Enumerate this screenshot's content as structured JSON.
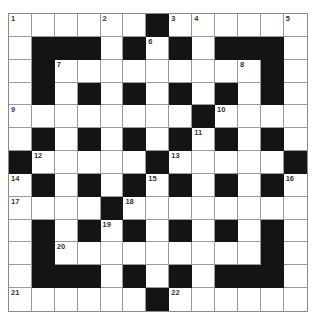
{
  "puzzle": {
    "rows": 13,
    "cols": 13,
    "layout": [
      "WWWWWWBWWWWWW",
      "WBBBWBWBWBBBW",
      "WBWWWWWWWWWBW",
      "WBWBWBWBWBWBW",
      "WWWWWWWWBWWWW",
      "WBWBWBWBWBWBW",
      "BWWWWWBWWWWWB",
      "WBWBWBWBWBWBW",
      "WWWWBWWWWWWWW",
      "WBWBWBWBWBWBW",
      "WBWWWWWWWWWBW",
      "WBBBWBWBWBBBW",
      "WWWWWWBWWWWWW"
    ],
    "numbers": [
      {
        "r": 0,
        "c": 0,
        "n": "1"
      },
      {
        "r": 0,
        "c": 4,
        "n": "2"
      },
      {
        "r": 0,
        "c": 7,
        "n": "3"
      },
      {
        "r": 0,
        "c": 8,
        "n": "4"
      },
      {
        "r": 0,
        "c": 12,
        "n": "5"
      },
      {
        "r": 1,
        "c": 6,
        "n": "6"
      },
      {
        "r": 2,
        "c": 2,
        "n": "7"
      },
      {
        "r": 2,
        "c": 10,
        "n": "8"
      },
      {
        "r": 4,
        "c": 0,
        "n": "9"
      },
      {
        "r": 4,
        "c": 9,
        "n": "10"
      },
      {
        "r": 5,
        "c": 8,
        "n": "11"
      },
      {
        "r": 6,
        "c": 1,
        "n": "12"
      },
      {
        "r": 6,
        "c": 7,
        "n": "13"
      },
      {
        "r": 7,
        "c": 0,
        "n": "14"
      },
      {
        "r": 7,
        "c": 6,
        "n": "15"
      },
      {
        "r": 7,
        "c": 12,
        "n": "16"
      },
      {
        "r": 8,
        "c": 0,
        "n": "17"
      },
      {
        "r": 8,
        "c": 5,
        "n": "18"
      },
      {
        "r": 9,
        "c": 4,
        "n": "19"
      },
      {
        "r": 10,
        "c": 2,
        "n": "20"
      },
      {
        "r": 12,
        "c": 0,
        "n": "21"
      },
      {
        "r": 12,
        "c": 7,
        "n": "22"
      }
    ]
  }
}
